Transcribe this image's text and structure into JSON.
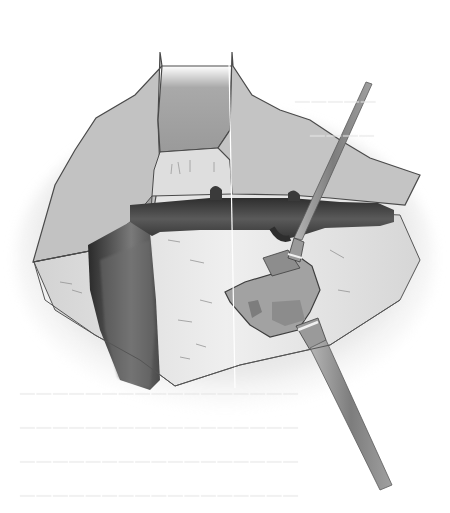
{
  "figure": {
    "kind": "surgical-illustration",
    "style": "grayscale pencil shading",
    "palette": {
      "background": "#ffffff",
      "tissue_light": "#c9c9c9",
      "tissue_mid": "#a8a8a8",
      "tissue_pale": "#e2e2e2",
      "vessel_dark": "#3c3c3c",
      "instrument": "#8f8f8f",
      "outline": "#4a4a4a"
    },
    "elements": [
      "left-tissue-flap",
      "right-tissue-flap",
      "central-dark-cavity",
      "horizontal-dark-vessel",
      "vertical-dark-vessel",
      "pale-tissue-bed",
      "retractor-instrument",
      "retracted-tissue-wedge"
    ]
  },
  "bleed_through_text": {
    "note": "faint illegible text from reverse of page",
    "lines": [
      "",
      "",
      "",
      "",
      "",
      "",
      ""
    ]
  }
}
